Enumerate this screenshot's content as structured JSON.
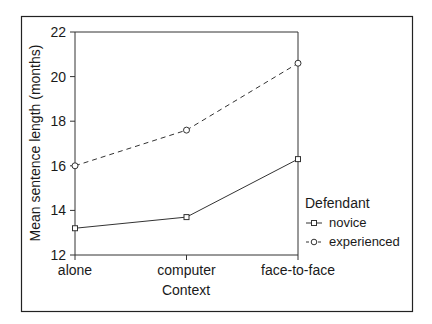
{
  "chart_data": {
    "type": "line",
    "title": "",
    "xlabel": "Context",
    "ylabel": "Mean sentence length (months)",
    "categories": [
      "alone",
      "computer",
      "face-to-face"
    ],
    "series": [
      {
        "name": "novice",
        "marker": "square",
        "line_style": "solid",
        "values": [
          13.2,
          13.7,
          16.3
        ]
      },
      {
        "name": "experienced",
        "marker": "circle",
        "line_style": "dashed",
        "values": [
          16.0,
          17.6,
          20.6
        ]
      }
    ],
    "ylim": [
      12,
      22
    ],
    "yticks": [
      12,
      14,
      16,
      18,
      20,
      22
    ],
    "grid": false,
    "legend": {
      "title": "Defendant",
      "position": "right"
    }
  },
  "colors": {
    "line": "#333333",
    "frame": "#222222"
  }
}
